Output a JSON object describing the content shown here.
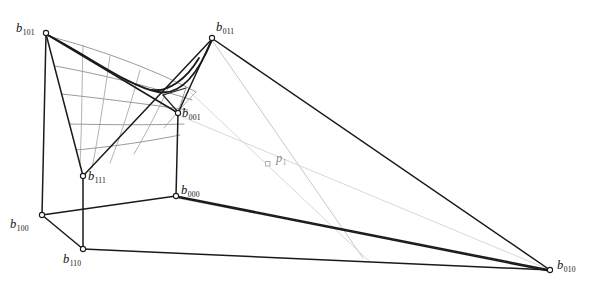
{
  "figure": {
    "background_color": "#ffffff",
    "stroke_color": "#1a1a1a",
    "grid_color": "#808080",
    "ray_color": "#c8c8c8",
    "muted_label_color": "#8c8c8c",
    "width": 589,
    "height": 287
  },
  "points": {
    "b101": {
      "base": "b",
      "sub": "101",
      "x": 46,
      "y": 33,
      "label_x": 16,
      "label_y": 22,
      "muted": false
    },
    "b011": {
      "base": "b",
      "sub": "011",
      "x": 212,
      "y": 38,
      "label_x": 216,
      "label_y": 22,
      "muted": false
    },
    "b001": {
      "base": "b",
      "sub": "001",
      "x": 178,
      "y": 113,
      "label_x": 182,
      "label_y": 108,
      "muted": false
    },
    "b111": {
      "base": "b",
      "sub": "111",
      "x": 83,
      "y": 176,
      "label_x": 88,
      "label_y": 171,
      "muted": false
    },
    "b000": {
      "base": "b",
      "sub": "000",
      "x": 176,
      "y": 196,
      "label_x": 180,
      "label_y": 184,
      "muted": false
    },
    "b100": {
      "base": "b",
      "sub": "100",
      "x": 42,
      "y": 215,
      "label_x": 10,
      "label_y": 219,
      "muted": false
    },
    "b110": {
      "base": "b",
      "sub": "110",
      "x": 83,
      "y": 249,
      "label_x": 63,
      "label_y": 252,
      "muted": false
    },
    "b010": {
      "base": "b",
      "sub": "010",
      "x": 550,
      "y": 270,
      "label_x": 556,
      "label_y": 260,
      "muted": false
    },
    "p1": {
      "base": "p",
      "sub": "1",
      "x": 268,
      "y": 164,
      "label_x": 276,
      "label_y": 152,
      "muted": true
    }
  },
  "annotations": {
    "label_b101": "b",
    "label_b011": "b",
    "label_b001": "b",
    "label_b111": "b",
    "label_b000": "b",
    "label_b100": "b",
    "label_b110": "b",
    "label_b010": "b",
    "label_p1": "p",
    "sub_b101": "101",
    "sub_b011": "011",
    "sub_b001": "001",
    "sub_b111": "111",
    "sub_b000": "000",
    "sub_b100": "100",
    "sub_b110": "110",
    "sub_b010": "010",
    "sub_p1": "1"
  }
}
